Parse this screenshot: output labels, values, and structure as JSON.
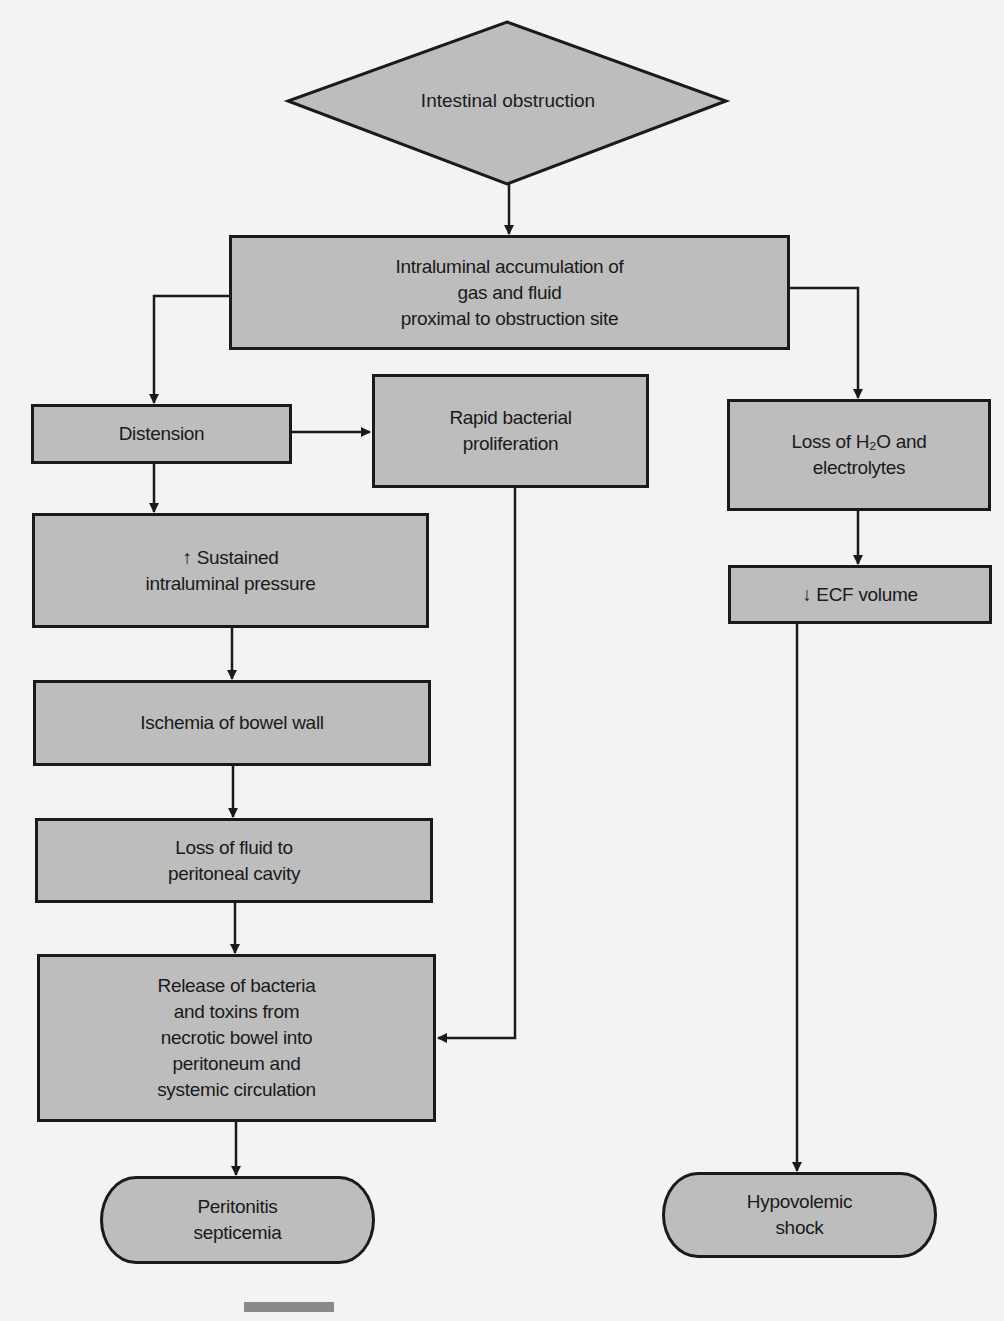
{
  "diagram": {
    "start": {
      "label": "Intestinal obstruction"
    },
    "nodes": {
      "accumulation": "Intraluminal accumulation of\ngas and fluid\nproximal to obstruction site",
      "distension": "Distension",
      "bacterial": "Rapid bacterial\nproliferation",
      "pressure": "↑ Sustained\nintraluminal pressure",
      "ischemia": "Ischemia of bowel wall",
      "fluid_loss": "Loss of fluid to\nperitoneal cavity",
      "release": "Release of bacteria\nand toxins from\nnecrotic bowel into\nperitoneum and\nsystemic circulation",
      "h2o_loss": "Loss of H₂O and\nelectrolytes",
      "ecf": "↓ ECF volume"
    },
    "outcomes": {
      "peritonitis": "Peritonitis\nsepticemia",
      "shock": "Hypovolemic\nshock"
    },
    "edges": [
      [
        "Intestinal obstruction",
        "Intraluminal accumulation"
      ],
      [
        "Intraluminal accumulation",
        "Distension"
      ],
      [
        "Intraluminal accumulation",
        "Loss of H2O and electrolytes"
      ],
      [
        "Distension",
        "Rapid bacterial proliferation"
      ],
      [
        "Distension",
        "Sustained intraluminal pressure"
      ],
      [
        "Sustained intraluminal pressure",
        "Ischemia of bowel wall"
      ],
      [
        "Ischemia of bowel wall",
        "Loss of fluid to peritoneal cavity"
      ],
      [
        "Loss of fluid to peritoneal cavity",
        "Release of bacteria and toxins"
      ],
      [
        "Rapid bacterial proliferation",
        "Release of bacteria and toxins"
      ],
      [
        "Release of bacteria and toxins",
        "Peritonitis septicemia"
      ],
      [
        "Loss of H2O and electrolytes",
        "ECF volume decrease"
      ],
      [
        "ECF volume decrease",
        "Hypovolemic shock"
      ]
    ],
    "colors": {
      "fill": "#bdbdbd",
      "stroke": "#1a1a1a",
      "background": "#f4f3f1"
    }
  }
}
